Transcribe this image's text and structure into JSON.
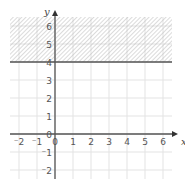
{
  "chart_data": {
    "type": "inequality-region",
    "title": "",
    "xlabel": "x",
    "ylabel": "y",
    "xlim": [
      -2.5,
      6.5
    ],
    "ylim": [
      -2.5,
      6.5
    ],
    "x_ticks": [
      "-2",
      "-1",
      "0",
      "1",
      "2",
      "3",
      "4",
      "5",
      "6"
    ],
    "y_ticks": [
      "-2",
      "-1",
      "0",
      "1",
      "2",
      "3",
      "4",
      "5",
      "6"
    ],
    "origin_label": "0",
    "grid": true,
    "boundary": {
      "type": "horizontal-line",
      "equation": "y = 4",
      "style": "solid"
    },
    "shaded_region": {
      "description": "y >= 4",
      "y_from": 4,
      "y_to": 6.5,
      "pattern": "diagonal-hatch"
    }
  },
  "colors": {
    "grid": "#e3e3e3",
    "axis": "#555555",
    "boundary": "#555555",
    "hatch": "#b8b8b8",
    "text": "#555555"
  }
}
